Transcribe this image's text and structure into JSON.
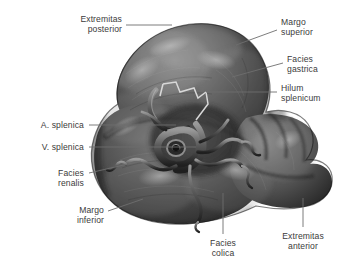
{
  "figure": {
    "style": "grayscale anatomical illustration",
    "background_color": "#ffffff",
    "label_color": "#3b3b3b",
    "leader_color": "#6e6e6e"
  },
  "labels": [
    {
      "id": "extremitas-posterior",
      "text": "Extremitas\nposterior",
      "align": "right",
      "x": 38,
      "y": 14,
      "w": 84,
      "leader": [
        [
          126,
          25
        ],
        [
          172,
          25
        ]
      ]
    },
    {
      "id": "margo-superior",
      "text": "Margo\nsuperior",
      "align": "left",
      "x": 281,
      "y": 17,
      "w": 62,
      "leader": [
        [
          277,
          30
        ],
        [
          236,
          45
        ]
      ]
    },
    {
      "id": "facies-gastrica",
      "text": "Facies\ngastrica",
      "align": "left",
      "x": 287,
      "y": 54,
      "w": 57,
      "leader": [
        [
          283,
          63
        ],
        [
          232,
          77
        ]
      ]
    },
    {
      "id": "hilum-splenicum",
      "text": "Hilum\nsplenicum",
      "align": "left",
      "x": 281,
      "y": 83,
      "w": 63,
      "leader": [
        [
          277,
          92
        ],
        [
          206,
          92
        ]
      ]
    },
    {
      "id": "a-splenica",
      "text": "A. splenica",
      "align": "right",
      "x": 22,
      "y": 120,
      "w": 62,
      "leader": [
        [
          89,
          125
        ],
        [
          176,
          125
        ]
      ]
    },
    {
      "id": "v-splenica",
      "text": "V. splenica",
      "align": "right",
      "x": 22,
      "y": 142,
      "w": 62,
      "leader": [
        [
          89,
          147
        ],
        [
          196,
          147
        ]
      ]
    },
    {
      "id": "facies-renalis",
      "text": "Facies\nrenalis",
      "align": "right",
      "x": 32,
      "y": 168,
      "w": 52,
      "leader": [
        [
          89,
          173
        ],
        [
          141,
          161
        ]
      ]
    },
    {
      "id": "margo-inferior",
      "text": "Margo\ninferior",
      "align": "right",
      "x": 50,
      "y": 205,
      "w": 54,
      "leader": [
        [
          108,
          211
        ],
        [
          143,
          199
        ]
      ]
    },
    {
      "id": "facies-colica",
      "text": "Facies\ncolica",
      "align": "center",
      "x": 199,
      "y": 238,
      "w": 48,
      "leader": [
        [
          223,
          234
        ],
        [
          223,
          193
        ]
      ]
    },
    {
      "id": "extremitas-anterior",
      "text": "Extremitas\nanterior",
      "align": "center",
      "x": 268,
      "y": 231,
      "w": 70,
      "leader": [
        [
          303,
          227
        ],
        [
          303,
          198
        ]
      ]
    }
  ]
}
